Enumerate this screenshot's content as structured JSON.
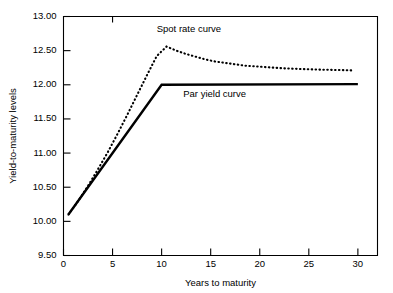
{
  "chart_data": {
    "type": "line",
    "title": "",
    "xlabel": "Years to maturity",
    "ylabel": "Yield-to-maturity levels",
    "xlim": [
      0,
      32
    ],
    "ylim": [
      9.5,
      13.0
    ],
    "grid": false,
    "legend_position": "inline-annotation",
    "xticks": [
      0,
      5,
      10,
      15,
      20,
      25,
      30
    ],
    "xtick_labels": [
      "0",
      "5",
      "10",
      "15",
      "20",
      "25",
      "30"
    ],
    "yticks": [
      9.5,
      10.0,
      10.5,
      11.0,
      11.5,
      12.0,
      12.5,
      13.0
    ],
    "ytick_labels": [
      "9.50",
      "10.00",
      "10.50",
      "11.00",
      "11.50",
      "12.00",
      "12.50",
      "13.00"
    ],
    "series": [
      {
        "name": "Par yield curve",
        "style": "solid",
        "label_x": 12.2,
        "label_y": 11.82,
        "x": [
          0.5,
          10.0,
          30.0
        ],
        "y": [
          10.1,
          12.0,
          12.01
        ]
      },
      {
        "name": "Spot rate curve",
        "style": "dotted",
        "label_x": 9.5,
        "label_y": 12.78,
        "x": [
          0.5,
          1.5,
          2.5,
          3.5,
          4.5,
          5.5,
          6.5,
          7.5,
          8.5,
          9.5,
          10.5,
          11.5,
          12.5,
          13.5,
          14.5,
          15.5,
          16.5,
          17.5,
          18.5,
          19.5,
          20.5,
          21.5,
          22.5,
          23.5,
          24.5,
          25.5,
          26.5,
          27.5,
          28.5,
          29.5
        ],
        "y": [
          10.1,
          10.3,
          10.52,
          10.76,
          11.01,
          11.28,
          11.56,
          11.85,
          12.14,
          12.42,
          12.56,
          12.5,
          12.45,
          12.41,
          12.37,
          12.34,
          12.32,
          12.3,
          12.28,
          12.27,
          12.26,
          12.25,
          12.24,
          12.235,
          12.23,
          12.225,
          12.22,
          12.218,
          12.215,
          12.21
        ]
      }
    ]
  }
}
